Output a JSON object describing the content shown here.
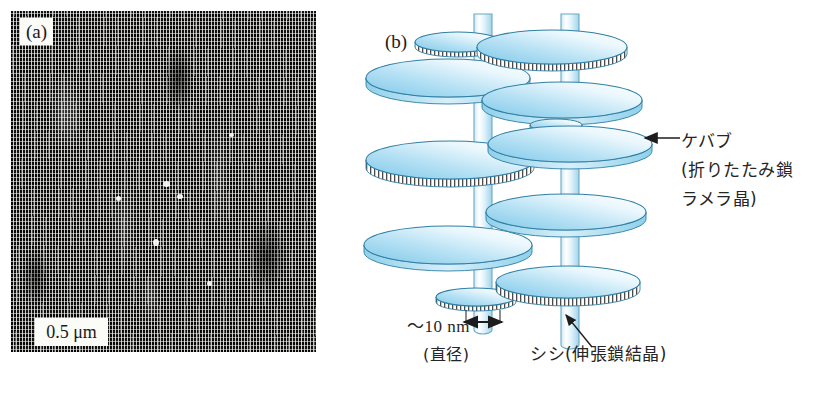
{
  "figure": {
    "panel_a": {
      "tag": "(a)",
      "scale_bar": "0.5 μm",
      "description": "transmission-electron-micrograph of shish-kebab crystals"
    },
    "panel_b": {
      "tag": "(b)",
      "description": "schematic of shish-kebab polymer crystal morphology",
      "labels": {
        "kebab_line1": "ケバブ",
        "kebab_line2": "(折りたたみ鎖",
        "kebab_line3": "ラメラ晶)",
        "shish": "シシ(伸張鎖結晶)",
        "diameter_value": "〜10 nm",
        "diameter_caption": "(直径)"
      }
    },
    "caption_remnant": ""
  },
  "colors": {
    "disk_light": "#f4fbfe",
    "disk_mid": "#bfe4f5",
    "disk_deep": "#79c7e8",
    "disk_edge": "#2f7fa4",
    "fiber_light": "#f2fbff",
    "fiber_mid": "#cdeaf7",
    "fiber_edge": "#6aa8c4",
    "ink": "#252525",
    "micrograph_dark": "#141312"
  },
  "geometry": {
    "left_fiber_x": 153,
    "right_fiber_x": 240,
    "disk_rx_large": 100,
    "disk_ry_large": 22
  }
}
